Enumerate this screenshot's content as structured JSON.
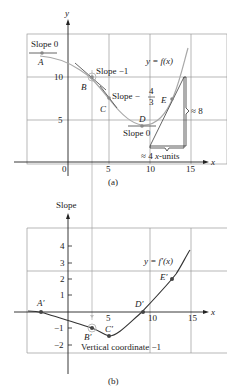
{
  "panel_a": {
    "caption": "(a)",
    "y_axis_label": "y",
    "x_axis_label": "x",
    "x_ticks": [
      "0",
      "5",
      "10",
      "15"
    ],
    "y_ticks": [
      "5",
      "10"
    ],
    "curve_label": "y = f(x)",
    "points": [
      {
        "name": "A",
        "x": -3.3,
        "y": 12.3,
        "slope_label": "Slope 0"
      },
      {
        "name": "B",
        "x": 3,
        "y": 10,
        "slope_label": "Slope −1"
      },
      {
        "name": "C",
        "x": 5,
        "y": 7.7,
        "slope_label": "Slope −",
        "slope_frac_num": "4",
        "slope_frac_den": "3"
      },
      {
        "name": "D",
        "x": 9,
        "y": 4.5,
        "slope_label": "Slope 0"
      },
      {
        "name": "E",
        "x": 12.7,
        "y": 7.2
      }
    ],
    "rise_label": "≈ 8",
    "run_label": "≈ 4 x-units",
    "run_prefix": "≈ 4 ",
    "run_x": "x",
    "run_suffix": "-units"
  },
  "panel_b": {
    "caption": "(b)",
    "y_axis_label": "Slope",
    "x_axis_label": "x",
    "x_ticks": [
      "5",
      "10",
      "15"
    ],
    "y_ticks": [
      "4",
      "3",
      "2",
      "1",
      "−1",
      "−2"
    ],
    "curve_label": "y = f′(x)",
    "points": [
      {
        "name": "A′",
        "x": -3.3,
        "y": 0
      },
      {
        "name": "B′",
        "x": 3,
        "y": -1
      },
      {
        "name": "C′",
        "x": 5,
        "y": -1.33
      },
      {
        "name": "D′",
        "x": 9,
        "y": 0
      },
      {
        "name": "E′",
        "x": 12.7,
        "y": 2
      }
    ],
    "annotation": "Vertical coordinate −1"
  },
  "colors": {
    "curve": "#a8a8a8",
    "derivative_curve": "#333333",
    "grid": "#9a9a9a",
    "axis": "#222222",
    "point": "#888888"
  }
}
